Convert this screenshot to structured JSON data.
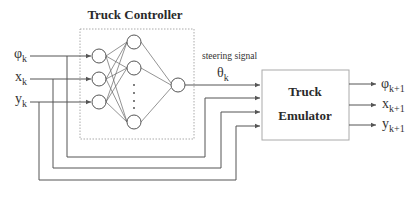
{
  "controller": {
    "title": "Truck  Controller",
    "network": {
      "input_nodes": 3,
      "hidden_nodes_shown": 3,
      "hidden_ellipsis": "· · · ·",
      "output_nodes": 1
    }
  },
  "inputs": [
    {
      "symbol": "φ",
      "subscript": "k"
    },
    {
      "symbol": "x",
      "subscript": "k"
    },
    {
      "symbol": "y",
      "subscript": "k"
    }
  ],
  "signal": {
    "label": "steering signal",
    "symbol": "θ",
    "subscript": "k"
  },
  "emulator": {
    "title_line1": "Truck",
    "title_line2": "Emulator"
  },
  "outputs": [
    {
      "symbol": "φ",
      "subscript": "k+1"
    },
    {
      "symbol": "x",
      "subscript": "k+1"
    },
    {
      "symbol": "y",
      "subscript": "k+1"
    }
  ]
}
